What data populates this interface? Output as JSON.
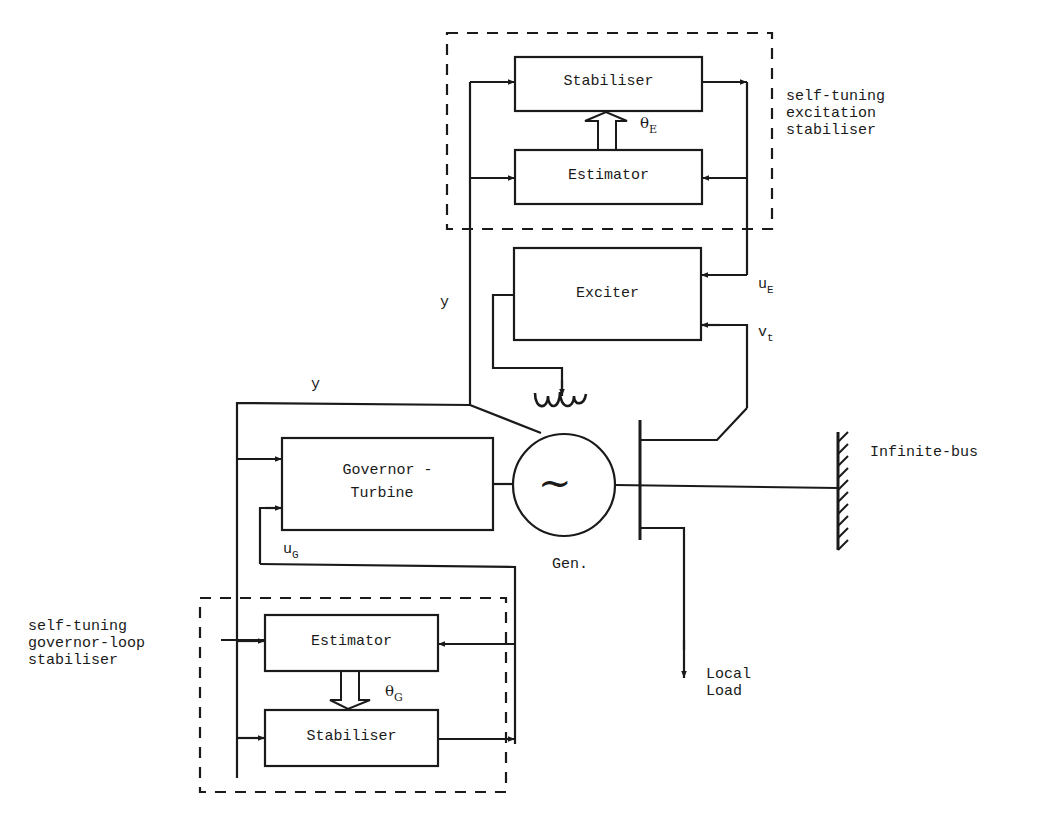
{
  "diagram": {
    "type": "block-diagram"
  },
  "groups": {
    "excitation": {
      "label_lines": [
        "self-tuning",
        "excitation",
        "stabiliser"
      ]
    },
    "governor": {
      "label_lines": [
        "self-tuning",
        "governor-loop",
        "stabiliser"
      ]
    }
  },
  "blocks": {
    "exc_stabiliser": "Stabiliser",
    "exc_estimator": "Estimator",
    "exciter": "Exciter",
    "governor_turbine_line1": "Governor -",
    "governor_turbine_line2": "Turbine",
    "gov_estimator": "Estimator",
    "gov_stabiliser": "Stabiliser"
  },
  "signals": {
    "theta_E": {
      "base": "θ",
      "sub": "E"
    },
    "theta_G": {
      "base": "θ",
      "sub": "G"
    },
    "u_E": {
      "base": "u",
      "sub": "E"
    },
    "v_t": {
      "base": "v",
      "sub": "t"
    },
    "u_G": {
      "base": "u",
      "sub": "G"
    },
    "y_upper": "y",
    "y_lower": "y"
  },
  "components": {
    "generator_symbol": "~",
    "generator_label": "Gen.",
    "infinite_bus": "Infinite-bus",
    "local_load_line1": "Local",
    "local_load_line2": "Load"
  },
  "colors": {
    "ink": "#1a1a1a",
    "background": "#ffffff"
  }
}
